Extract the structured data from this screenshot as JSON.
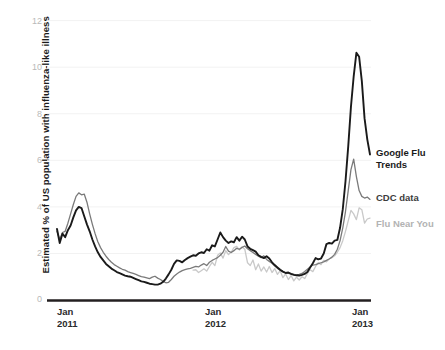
{
  "chart_data": {
    "type": "line",
    "title": "",
    "subtitle": "",
    "xlabel": "",
    "ylabel": "Estimated % of US population with influenza-like illness",
    "ylim": [
      0,
      12
    ],
    "yticks": [
      0,
      2,
      4,
      6,
      8,
      10,
      12
    ],
    "ytick_labels": [
      "0",
      "2",
      "4",
      "6",
      "8",
      "10",
      "12"
    ],
    "grid": true,
    "grid_axis": "y",
    "legend_position": "right-inline",
    "xticks": [
      0,
      52,
      104
    ],
    "xtick_labels": [
      "Jan\n2011",
      "Jan\n2012",
      "Jan\n2013"
    ],
    "xtick_month": [
      "Jan",
      "Jan",
      "Jan"
    ],
    "xtick_year": [
      "2011",
      "2012",
      "2013"
    ],
    "x_unit": "weeks since Jan 2011",
    "xlim": [
      -3,
      116
    ],
    "series": [
      {
        "name": "Google Flu Trends",
        "color": "#1a1a1a",
        "width": 1.9,
        "label_color": "#1a1a1a",
        "values": [
          3.05,
          2.45,
          2.85,
          2.7,
          3.0,
          3.2,
          3.55,
          3.85,
          4.0,
          3.95,
          3.6,
          3.25,
          2.95,
          2.6,
          2.3,
          2.05,
          1.85,
          1.7,
          1.55,
          1.45,
          1.35,
          1.28,
          1.2,
          1.15,
          1.1,
          1.05,
          1.02,
          1.0,
          0.95,
          0.9,
          0.85,
          0.8,
          0.78,
          0.74,
          0.7,
          0.68,
          0.66,
          0.66,
          0.7,
          0.78,
          0.92,
          1.1,
          1.3,
          1.55,
          1.7,
          1.68,
          1.62,
          1.72,
          1.8,
          1.86,
          1.92,
          1.9,
          2.0,
          2.05,
          2.02,
          2.18,
          2.12,
          2.35,
          2.3,
          2.6,
          2.9,
          2.7,
          2.55,
          2.45,
          2.52,
          2.48,
          2.7,
          2.55,
          2.72,
          2.6,
          2.3,
          2.2,
          2.14,
          2.08,
          1.92,
          1.85,
          1.8,
          1.88,
          1.78,
          1.62,
          1.5,
          1.4,
          1.3,
          1.22,
          1.16,
          1.18,
          1.12,
          1.08,
          1.06,
          1.05,
          1.08,
          1.12,
          1.2,
          1.4,
          1.58,
          1.8,
          1.75,
          1.78,
          2.0,
          2.4,
          2.45,
          2.42,
          2.55,
          2.58,
          3.1,
          3.9,
          5.1,
          6.6,
          8.3,
          9.6,
          10.62,
          10.45,
          9.4,
          7.8,
          6.9,
          6.25
        ]
      },
      {
        "name": "CDC data",
        "color": "#7a7a7a",
        "width": 1.3,
        "label_color": "#3c3c3c",
        "values": [
          2.95,
          2.6,
          2.9,
          2.95,
          3.3,
          3.7,
          4.1,
          4.45,
          4.6,
          4.52,
          4.55,
          4.2,
          3.7,
          3.25,
          2.85,
          2.5,
          2.25,
          2.05,
          1.88,
          1.74,
          1.62,
          1.52,
          1.45,
          1.38,
          1.32,
          1.28,
          1.22,
          1.18,
          1.14,
          1.1,
          1.05,
          1.0,
          0.98,
          0.95,
          0.92,
          0.98,
          1.02,
          0.94,
          0.88,
          0.8,
          0.74,
          0.76,
          0.88,
          1.02,
          1.12,
          1.2,
          1.26,
          1.3,
          1.34,
          1.36,
          1.4,
          1.44,
          1.42,
          1.5,
          1.56,
          1.48,
          1.62,
          1.7,
          1.76,
          1.82,
          1.92,
          2.05,
          2.3,
          2.1,
          2.04,
          2.12,
          2.22,
          2.18,
          2.26,
          2.32,
          2.2,
          2.12,
          2.04,
          1.96,
          1.88,
          1.82,
          1.9,
          1.74,
          1.66,
          1.58,
          1.46,
          1.36,
          1.28,
          1.22,
          1.18,
          1.14,
          1.12,
          1.1,
          1.08,
          1.1,
          1.14,
          1.22,
          1.32,
          1.42,
          1.5,
          1.52,
          1.56,
          1.6,
          1.64,
          1.7,
          1.76,
          1.84,
          1.96,
          2.18,
          2.55,
          3.1,
          3.8,
          4.7,
          5.6,
          6.05,
          5.3,
          4.7,
          4.45,
          4.38,
          4.42,
          4.32
        ]
      },
      {
        "name": "Flu Near You",
        "color": "#c9c9c9",
        "width": 1.3,
        "label_color": "#b3b3b3",
        "values": [
          null,
          null,
          null,
          null,
          null,
          null,
          null,
          null,
          null,
          null,
          null,
          null,
          null,
          null,
          null,
          null,
          null,
          null,
          null,
          null,
          null,
          null,
          null,
          null,
          null,
          null,
          null,
          null,
          null,
          null,
          null,
          null,
          null,
          null,
          null,
          null,
          null,
          null,
          null,
          null,
          null,
          null,
          null,
          null,
          null,
          null,
          null,
          null,
          null,
          null,
          1.28,
          1.3,
          1.18,
          1.26,
          1.34,
          1.24,
          1.44,
          1.62,
          1.48,
          1.92,
          2.02,
          1.8,
          2.12,
          1.95,
          2.05,
          2.25,
          2.3,
          2.15,
          2.28,
          2.18,
          1.6,
          1.48,
          1.72,
          1.3,
          1.55,
          1.24,
          1.42,
          1.2,
          1.44,
          1.18,
          1.35,
          1.1,
          1.26,
          0.96,
          1.12,
          0.88,
          1.05,
          0.82,
          0.98,
          0.86,
          1.0,
          0.92,
          1.14,
          1.3,
          1.22,
          1.44,
          1.6,
          1.52,
          1.7,
          1.64,
          1.76,
          1.82,
          1.9,
          2.05,
          2.25,
          2.55,
          2.95,
          3.4,
          3.85,
          3.7,
          3.45,
          3.96,
          3.88,
          3.3,
          3.48,
          3.52
        ]
      }
    ],
    "annotations": [
      {
        "text": "Google Flu Trends",
        "x_px": 376,
        "y_px": 152,
        "bold": true
      },
      {
        "text": "CDC data",
        "x_px": 376,
        "y_px": 196,
        "bold": true
      },
      {
        "text": "Flu Near You",
        "x_px": 376,
        "y_px": 222,
        "bold": true
      }
    ]
  },
  "axis": {
    "y_title": "Estimated % of US population with influenza-like illness",
    "y_ticks": [
      "12",
      "10",
      "8",
      "6",
      "4",
      "2",
      "0"
    ],
    "x_ticks": [
      {
        "month": "Jan",
        "year": "2011"
      },
      {
        "month": "Jan",
        "year": "2012"
      },
      {
        "month": "Jan",
        "year": "2013"
      }
    ]
  },
  "legend": {
    "gft": "Google Flu\nTrends",
    "cdc": "CDC data",
    "fny": "Flu Near You"
  },
  "colors": {
    "gft": "#1a1a1a",
    "cdc": "#7a7a7a",
    "fny": "#c9c9c9",
    "grid": "#f2f2f2",
    "axis": "#231f20",
    "tick_text": "#b9b9b9",
    "background": "#ffffff"
  }
}
